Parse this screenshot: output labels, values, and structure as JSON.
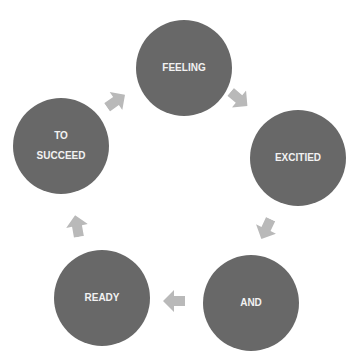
{
  "diagram": {
    "type": "cycle",
    "nodes": [
      {
        "id": "feeling",
        "label": "FEELING"
      },
      {
        "id": "excitied",
        "label": "EXCITIED"
      },
      {
        "id": "and",
        "label": "AND"
      },
      {
        "id": "ready",
        "label": "READY"
      },
      {
        "id": "to-succeed",
        "label_line1": "TO",
        "label_line2": "SUCCEED"
      }
    ],
    "colors": {
      "node_fill": "#686868",
      "node_text": "#f2f2f2",
      "arrow_fill": "#b9b9b9"
    }
  }
}
